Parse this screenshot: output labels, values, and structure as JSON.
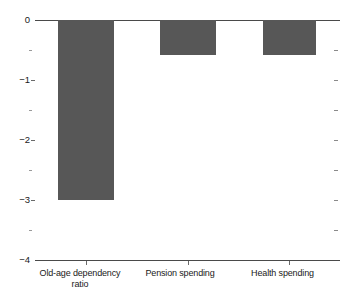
{
  "chart_data": {
    "type": "bar",
    "title": "",
    "subtitle": "",
    "xlabel": "",
    "ylabel": "",
    "categories": [
      "Old-age dependency\nratio",
      "Pension spending",
      "Health spending"
    ],
    "values": [
      -3.0,
      -0.58,
      -0.58
    ],
    "ylim": [
      -4,
      0
    ],
    "ytick_labels": [
      "0",
      "−1",
      "−2",
      "−3",
      "−4"
    ],
    "ytick_values": [
      0,
      -1,
      -2,
      -3,
      -4
    ],
    "minor_tick_values": [
      -0.5,
      -1.5,
      -2.5,
      -3.5
    ],
    "grid": false,
    "legend": null,
    "bar_color": "#575757",
    "axis_color": "#4a4a4a"
  },
  "axis": {
    "y_labels": [
      {
        "text": "0"
      },
      {
        "text": "−1"
      },
      {
        "text": "−2"
      },
      {
        "text": "−3"
      },
      {
        "text": "−4"
      }
    ],
    "x_labels": [
      {
        "text": "Old-age dependency\nratio"
      },
      {
        "text": "Pension spending"
      },
      {
        "text": "Health spending"
      }
    ]
  }
}
